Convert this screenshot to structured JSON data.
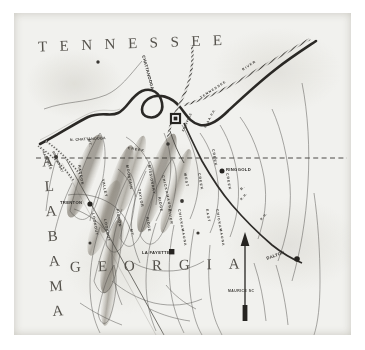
{
  "figure": {
    "kind": "antique-halftone-map",
    "region": "Chattanooga campaign region",
    "paper_color": "#f1f1ee",
    "ink_color": "#3c3a36",
    "river_ink": "#2b2926"
  },
  "states": [
    {
      "name": "TENNESSEE",
      "letters": [
        "T",
        "E",
        "N",
        "N",
        "E",
        "S",
        "S",
        "E",
        "E"
      ]
    },
    {
      "name": "ALABAMA",
      "letters": [
        "A",
        "L",
        "A",
        "B",
        "A",
        "M",
        "A"
      ]
    },
    {
      "name": "GEORGIA",
      "letters": [
        "G",
        "E",
        "O",
        "R",
        "G",
        "I",
        "A"
      ]
    }
  ],
  "towns": [
    {
      "label": "CHATTANOOGA",
      "marker": "square"
    },
    {
      "label": "TRENTON",
      "marker": "dot"
    },
    {
      "label": "RINGGOLD",
      "marker": "dot"
    },
    {
      "label": "LA FAYETTE",
      "marker": "square"
    },
    {
      "label": "DALTON",
      "marker": "dot"
    }
  ],
  "waterways": [
    {
      "label": "TENNESSEE"
    },
    {
      "label": "RIVER"
    },
    {
      "label": "CHICKAMAUGA"
    },
    {
      "label": "CREEK"
    },
    {
      "label": "WEST"
    },
    {
      "label": "CHICKAMAUGA"
    },
    {
      "label": "CREEK"
    },
    {
      "label": "EAST"
    },
    {
      "label": "CHICKAMAUGA"
    },
    {
      "label": "CREEK"
    },
    {
      "label": "RIVER"
    },
    {
      "label": "CREEK"
    },
    {
      "label": "R."
    }
  ],
  "ridges": [
    {
      "label": "RACOON"
    },
    {
      "label": "MT."
    },
    {
      "label": "LOOKOUT"
    },
    {
      "label": "MOUNTAIN"
    },
    {
      "label": "PIGEON"
    },
    {
      "label": "MT."
    },
    {
      "label": "MISSIONARY"
    },
    {
      "label": "RIDGE"
    },
    {
      "label": "TAYLOR"
    },
    {
      "label": "RIDGE"
    },
    {
      "label": "LOOKOUT"
    },
    {
      "label": "VALLEY"
    }
  ],
  "railroads": [
    {
      "label": "N. CHATTANOOGA"
    },
    {
      "label": "NASHVILLE"
    },
    {
      "label": "BRIDGEPORT"
    },
    {
      "label": "KNOXVILLE"
    },
    {
      "label": "W. & A. R.R."
    },
    {
      "label": "R. R."
    },
    {
      "label": "R. R."
    }
  ],
  "compass": {
    "direction": "north-arrow"
  },
  "credit": {
    "text": "MAURICE SC"
  },
  "boundary": {
    "label": "state-line-dashed"
  }
}
